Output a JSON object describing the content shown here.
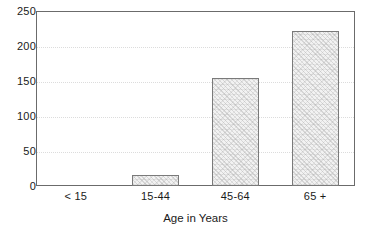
{
  "chart_data": {
    "type": "bar",
    "title": "",
    "subtitle": "",
    "xlabel": "Age in Years",
    "ylabel": "",
    "categories": [
      "< 15",
      "15-44",
      "45-64",
      "65 +"
    ],
    "values": [
      0,
      16,
      154,
      222
    ],
    "series": [
      {
        "name": "",
        "values": [
          0,
          16,
          154,
          222
        ]
      }
    ],
    "ylim": [
      0,
      250
    ],
    "yticks": [
      0,
      50,
      100,
      150,
      200,
      250
    ],
    "ytick_labels": [
      "0",
      "50",
      "100",
      "150",
      "200",
      "250"
    ],
    "grid": true,
    "grid_axis": "y",
    "grid_style": "dotted",
    "legend": false,
    "legend_position": "none",
    "annotations": [],
    "colors": {
      "bar_fill": "#f2f2f2",
      "bar_edge": "#7a7a7a",
      "grid": "#dcdcdc",
      "frame": "#6b6b6b",
      "text": "#1a1a1a",
      "background": "#ffffff"
    }
  }
}
